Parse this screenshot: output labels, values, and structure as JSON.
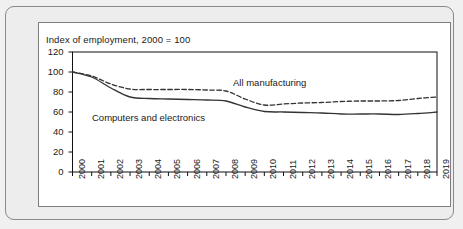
{
  "figure": {
    "title": "Index of employment, 2000 = 100",
    "colors": {
      "line": "#333333",
      "axis": "#000000",
      "panel_bg": "#ffffff",
      "frame_bg": "#ededed",
      "frame_border": "#8a8a8a"
    }
  },
  "chart_data": {
    "type": "line",
    "title": "Index of employment, 2000 = 100",
    "xlabel": "",
    "ylabel": "",
    "ylim": [
      0,
      120
    ],
    "yticks": [
      0,
      20,
      40,
      60,
      80,
      100,
      120
    ],
    "grid": false,
    "legend": "inline-labels",
    "categories": [
      "2000",
      "2001",
      "2002",
      "2003",
      "2004",
      "2005",
      "2006",
      "2007",
      "2008",
      "2009",
      "2010",
      "2011",
      "2012",
      "2013",
      "2014",
      "2015",
      "2016",
      "2017",
      "2018",
      "2019"
    ],
    "series": [
      {
        "name": "All manufacturing",
        "style": "dashed",
        "values": [
          100,
          96,
          88,
          83,
          82.5,
          82.5,
          82.5,
          82,
          81,
          73,
          67,
          68,
          69,
          69.5,
          70.5,
          71,
          71,
          71.5,
          73.5,
          75
        ]
      },
      {
        "name": "Computers and electronics",
        "style": "solid",
        "values": [
          100,
          95,
          84,
          75,
          73.5,
          73,
          72.5,
          72,
          71,
          65,
          60.5,
          60,
          59.5,
          59,
          58,
          58,
          58,
          57.5,
          58.5,
          60
        ]
      }
    ],
    "annotations": [
      {
        "text": "All manufacturing",
        "series": "All manufacturing"
      },
      {
        "text": "Computers and electronics",
        "series": "Computers and electronics"
      }
    ]
  }
}
